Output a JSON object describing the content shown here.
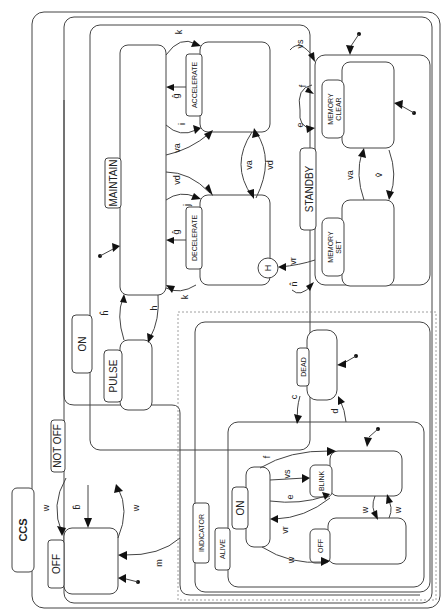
{
  "diagram": {
    "orientation": "rotated-90-ccw",
    "root": {
      "label": "CCS"
    },
    "states": {
      "off": {
        "label": "OFF"
      },
      "not_off": {
        "label": "NOT OFF"
      },
      "on": {
        "label": "ON"
      },
      "maintain": {
        "label": "MAINTAIN"
      },
      "accelerate": {
        "label": "ACCELERATE"
      },
      "decelerate": {
        "label": "DECELERATE"
      },
      "pulse": {
        "label": "PULSE"
      },
      "standby": {
        "label": "STANDBY"
      },
      "memory_clear": {
        "label_line1": "MEMORY",
        "label_line2": "CLEAR"
      },
      "memory_set": {
        "label_line1": "MEMORY",
        "label_line2": "SET"
      },
      "history": {
        "label": "H"
      },
      "indicator": {
        "label": "INDICATOR"
      },
      "alive": {
        "label": "ALIVE"
      },
      "dead": {
        "label": "DEAD"
      },
      "ind_on": {
        "label": "ON"
      },
      "blink": {
        "label": "BLINK"
      },
      "ind_off": {
        "label": "OFF"
      }
    },
    "transitions": {
      "w_off_to": "w",
      "b_hat": "b̂",
      "w_to_off": "w",
      "m": "m",
      "k_top": "k",
      "i_top": "i",
      "g_hat_top": "ĝ",
      "va_left": "va",
      "vd_left": "vd",
      "va_right": "va",
      "vd_right": "vd",
      "j": "j",
      "g_hat_bottom": "ĝ",
      "k_bottom": "k",
      "h_hat": "ĥ",
      "h": "h",
      "vs": "vs",
      "f": "f",
      "e": "e",
      "vr": "vr",
      "n_hat": "n̂",
      "va_mem": "va",
      "v_hat": "v̂",
      "c": "c",
      "d": "d",
      "f_ind": "f",
      "vs_ind": "vs",
      "e_ind": "e",
      "vr_ind": "vr",
      "w_ind": "w",
      "w_blink_off": "w",
      "w_off_blink": "w"
    }
  }
}
